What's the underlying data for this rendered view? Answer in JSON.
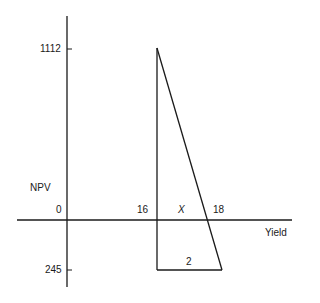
{
  "diagram": {
    "y_axis_label": "NPV",
    "x_axis_label": "Yield",
    "origin_label": "0",
    "y_ticks": [
      {
        "label": "1112",
        "meaning": "NPV at 16%"
      },
      {
        "label": "245",
        "meaning": "NPV at 18% (negative)"
      }
    ],
    "x_points": [
      {
        "label": "16"
      },
      {
        "label": "18"
      }
    ],
    "unknown_label": "X",
    "base_label": "2",
    "line_color": "#1a1a1a"
  }
}
